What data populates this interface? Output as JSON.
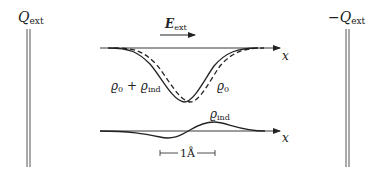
{
  "plates": {
    "left": {
      "label": "Q",
      "sub": "ext",
      "prefix": ""
    },
    "right": {
      "label": "Q",
      "sub": "ext",
      "prefix": "−"
    }
  },
  "field": {
    "label": "E",
    "sub": "ext"
  },
  "top_plot": {
    "axis_label": "x",
    "curve_labels": {
      "total": {
        "a": "ϱ",
        "a_sub": "0",
        "plus": " + ",
        "b": "ϱ",
        "b_sub": "ind"
      },
      "bare": {
        "a": "ϱ",
        "a_sub": "0"
      }
    }
  },
  "bottom_plot": {
    "axis_label": "x",
    "curve_label": {
      "a": "ϱ",
      "a_sub": "ind"
    }
  },
  "scale_bar": {
    "label": "1Å"
  },
  "colors": {
    "ink": "#222222",
    "plate": "#555555"
  }
}
